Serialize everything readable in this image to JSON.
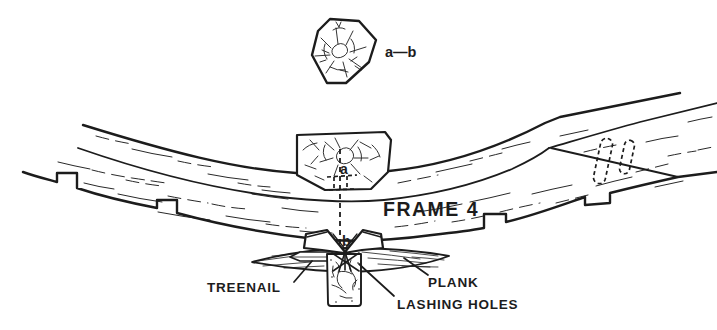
{
  "figure": {
    "background": "#ffffff",
    "ink": "#1c1c1c",
    "labels": {
      "section": "a—b",
      "point_a": "a",
      "point_b": "b",
      "frame": "FRAME 4",
      "treenail": "TREENAIL",
      "plank": "PLANK",
      "lashing_holes": "LASHING HOLES"
    }
  }
}
